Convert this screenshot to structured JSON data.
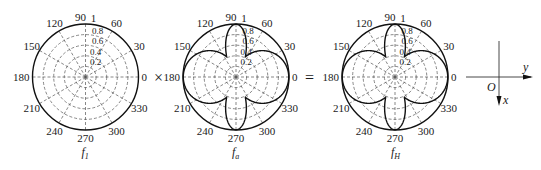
{
  "chart_data": [
    {
      "type": "polar",
      "name": "f1",
      "caption": "f",
      "caption_sub": "1",
      "angle_ticks": [
        0,
        30,
        60,
        90,
        120,
        150,
        180,
        210,
        240,
        270,
        300,
        330
      ],
      "radial_ticks": [
        0.2,
        0.4,
        0.6,
        0.8,
        1
      ],
      "rlim": [
        0,
        1
      ],
      "pattern": "omnidirectional",
      "description": "Unit circle r = 1 for all angles"
    },
    {
      "type": "polar",
      "name": "fa",
      "caption": "f",
      "caption_sub": "a",
      "angle_ticks": [
        0,
        30,
        60,
        90,
        120,
        150,
        180,
        210,
        240,
        270,
        300,
        330
      ],
      "radial_ticks": [
        0.2,
        0.4,
        0.6,
        0.8,
        1
      ],
      "rlim": [
        0,
        1
      ],
      "pattern": "four-lobe",
      "description": "Wide lobes at 0 and 180 deg (r approx |cos theta|), narrow lobes at 90 and 270 deg, peak r = 1"
    },
    {
      "type": "polar",
      "name": "fH",
      "caption": "f",
      "caption_sub": "H",
      "angle_ticks": [
        0,
        30,
        60,
        90,
        120,
        150,
        180,
        210,
        240,
        270,
        300,
        330
      ],
      "radial_ticks": [
        0.2,
        0.4,
        0.6,
        0.8,
        1
      ],
      "rlim": [
        0,
        1
      ],
      "pattern": "four-lobe",
      "description": "Product f1 x fa; identical four-lobe pattern"
    }
  ],
  "operators": {
    "times": "×",
    "equals": "="
  },
  "axes": {
    "origin": "O",
    "horizontal": "y",
    "vertical": "x"
  },
  "colors": {
    "line": "#111111",
    "grid": "#555555"
  }
}
